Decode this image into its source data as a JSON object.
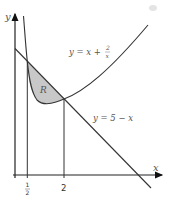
{
  "diagram": {
    "axes": {
      "x_label": "x",
      "y_label": "y"
    },
    "curve": {
      "label_lhs": "y = x + ",
      "frac_num": "2",
      "frac_den": "x",
      "equation": "y = x + 2/x"
    },
    "line": {
      "label": "y = 5 − x",
      "equation": "y = 5 - x"
    },
    "region": {
      "label": "R",
      "fill": "#c8c8c8"
    },
    "ticks": [
      {
        "x": 0.5,
        "label_num": "1",
        "label_den": "2"
      },
      {
        "x": 2,
        "label": "2"
      }
    ],
    "intersections": [
      {
        "x": 0.5,
        "y": 4.5
      },
      {
        "x": 2,
        "y": 3
      }
    ],
    "colors": {
      "stroke": "#333333",
      "region": "#c8c8c8",
      "text": "#555555"
    }
  }
}
